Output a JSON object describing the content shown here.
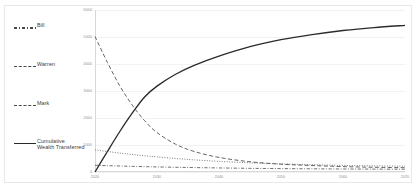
{
  "chart_data": {
    "type": "line",
    "title": "",
    "xlabel": "",
    "ylabel": "",
    "xlim": [
      2020,
      2070
    ],
    "ylim": [
      0,
      6000
    ],
    "grid": true,
    "legend_position": "left-outside",
    "x_ticks": [
      "2020",
      "2030",
      "2040",
      "2050",
      "2060",
      "2070"
    ],
    "y_ticks": [
      "0",
      "1000",
      "2000",
      "3000",
      "4000",
      "5000",
      "6000"
    ],
    "x": [
      2020,
      2022,
      2024,
      2026,
      2028,
      2030,
      2033,
      2036,
      2040,
      2045,
      2050,
      2055,
      2060,
      2065,
      2070
    ],
    "series": [
      {
        "name": "Cumulative Wealth Transferred",
        "style": "solid",
        "color": "#2b2b2b",
        "values": [
          0,
          760,
          1500,
          2180,
          2780,
          3180,
          3620,
          3950,
          4290,
          4640,
          4900,
          5090,
          5240,
          5350,
          5430
        ]
      },
      {
        "name": "Warren",
        "style": "dashed",
        "color": "#4a4a4a",
        "values": [
          5020,
          4060,
          3190,
          2480,
          1900,
          1460,
          1030,
          760,
          540,
          380,
          290,
          240,
          200,
          175,
          160
        ]
      },
      {
        "name": "Mark",
        "style": "dotted",
        "color": "#4a4a4a",
        "values": [
          820,
          760,
          700,
          650,
          600,
          560,
          500,
          450,
          395,
          340,
          300,
          270,
          245,
          228,
          215
        ]
      },
      {
        "name": "Bill",
        "style": "dashdot",
        "color": "#4a4a4a",
        "values": [
          250,
          235,
          222,
          210,
          198,
          188,
          175,
          164,
          150,
          136,
          126,
          118,
          112,
          107,
          103
        ]
      }
    ]
  },
  "legend": {
    "items": [
      {
        "label": "Bill",
        "style": "dashdot"
      },
      {
        "label": "Warren",
        "style": "dash"
      },
      {
        "label": "Mark",
        "style": "dash"
      },
      {
        "label": "Cumulative\nWealth Transferred",
        "style": "solid"
      }
    ]
  }
}
